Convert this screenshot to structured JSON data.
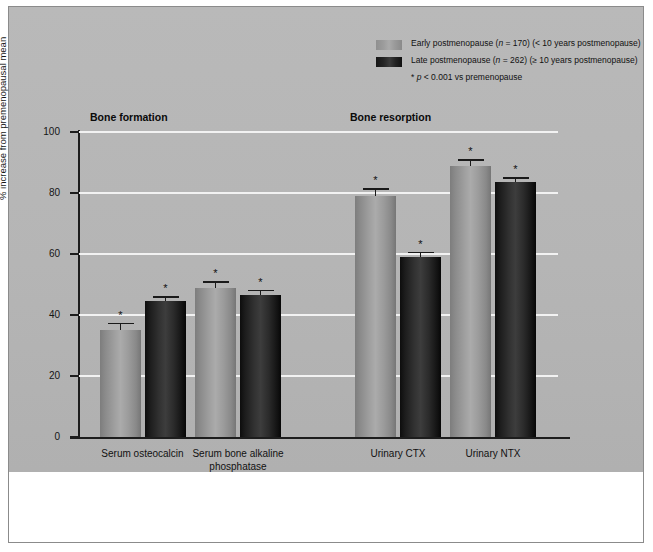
{
  "figure": {
    "background_color": "#b5b5b5",
    "page_color": "#ffffff",
    "border_color": "#8b8b8b"
  },
  "legend": {
    "position": "top-right",
    "items": [
      {
        "key": "early",
        "color": "#9d9d9d",
        "label_pre": "Early postmenopause (",
        "label_italic": "n",
        "label_post": " = 170) (< 10 years postmenopause)"
      },
      {
        "key": "late",
        "color": "#1e1e1e",
        "label_pre": "Late postmenopause (",
        "label_italic": "n",
        "label_post": " = 262) (≥ 10 years postmenopause)"
      }
    ],
    "note_pre": "* ",
    "note_italic": "p",
    "note_post": " < 0.001 vs premenopause"
  },
  "headings": {
    "formation": "Bone formation",
    "resorption": "Bone resorption"
  },
  "chart_data": {
    "type": "bar",
    "title": "",
    "xlabel": "",
    "ylabel": "% increase from premenopausal mean",
    "ylim": [
      0,
      100
    ],
    "yticks": [
      0,
      20,
      40,
      60,
      80,
      100
    ],
    "ytick_labels": [
      "0",
      "20",
      "40",
      "60",
      "80",
      "100"
    ],
    "grid": "horizontal",
    "gridline_color": "#f2f2f2",
    "legend_position": "top-right",
    "significance_marker": "*",
    "categories": [
      "Serum osteocalcin",
      "Serum bone alkaline phosphatase",
      "Urinary CTX",
      "Urinary NTX"
    ],
    "category_labels": [
      [
        "Serum osteocalcin"
      ],
      [
        "Serum bone alkaline",
        "phosphatase"
      ],
      [
        "Urinary CTX"
      ],
      [
        "Urinary NTX"
      ]
    ],
    "groups": [
      {
        "name": "Bone formation",
        "categories": [
          "Serum osteocalcin",
          "Serum bone alkaline phosphatase"
        ]
      },
      {
        "name": "Bone resorption",
        "categories": [
          "Urinary CTX",
          "Urinary NTX"
        ]
      }
    ],
    "series": [
      {
        "name": "Early postmenopause (n = 170) (< 10 years postmenopause)",
        "key": "early",
        "color": "#9d9d9d",
        "values": [
          35,
          49,
          79,
          89
        ],
        "errors": [
          2.5,
          2.0,
          2.5,
          2.0
        ],
        "significant": [
          true,
          true,
          true,
          true
        ]
      },
      {
        "name": "Late postmenopause (n = 262) (≥ 10 years postmenopause)",
        "key": "late",
        "color": "#1e1e1e",
        "values": [
          44.5,
          46.5,
          59,
          83.5
        ],
        "errors": [
          1.8,
          1.8,
          1.8,
          1.8
        ],
        "significant": [
          true,
          true,
          true,
          true
        ]
      }
    ]
  }
}
